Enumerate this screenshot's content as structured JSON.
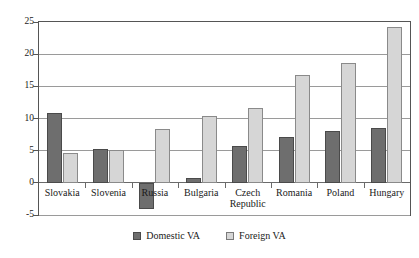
{
  "chart_data": {
    "type": "bar",
    "title": "",
    "subtitle": "",
    "xlabel": "",
    "ylabel": "",
    "ylim": [
      -5,
      25
    ],
    "yticks": [
      -5,
      0,
      5,
      10,
      15,
      20,
      25
    ],
    "ytick_labels": [
      "-5",
      "0",
      "5",
      "10",
      "15",
      "20",
      "25"
    ],
    "grid": true,
    "legend_position": "bottom-center",
    "categories": [
      "Slovakia",
      "Slovenia",
      "Russia",
      "Bulgaria",
      "Czech Republic",
      "Romania",
      "Poland",
      "Hungary"
    ],
    "series": [
      {
        "name": "Domestic VA",
        "color": "#6e6e6e",
        "values": [
          10.9,
          5.2,
          -4.1,
          0.8,
          5.7,
          7.1,
          8.0,
          8.5
        ]
      },
      {
        "name": "Foreign VA",
        "color": "#d6d6d6",
        "values": [
          4.7,
          5.1,
          8.4,
          10.4,
          11.6,
          16.7,
          18.6,
          24.2
        ]
      }
    ]
  },
  "legend": {
    "items": [
      {
        "label": "Domestic VA",
        "swatch": "domestic-swatch"
      },
      {
        "label": "Foreign VA",
        "swatch": "foreign-swatch"
      }
    ]
  }
}
